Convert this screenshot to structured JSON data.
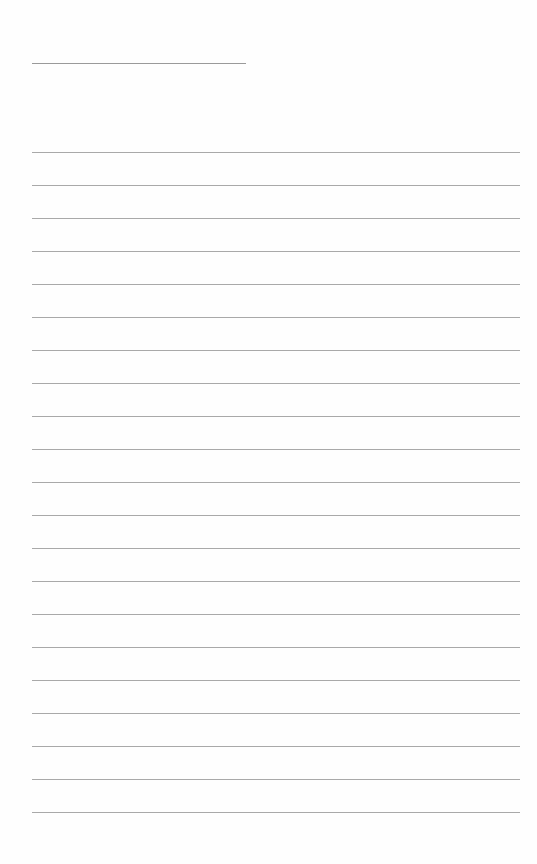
{
  "document": {
    "type": "lined-paper",
    "header_rule": {
      "top": 63,
      "left": 32,
      "width": 214
    },
    "body_rules": {
      "count": 21,
      "first_top": 152,
      "spacing": 33,
      "left": 32,
      "width": 488
    },
    "colors": {
      "paper": "#fefefe",
      "rule": "#a9a9a9"
    }
  }
}
